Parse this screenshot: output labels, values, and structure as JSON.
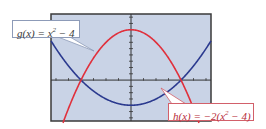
{
  "figure": {
    "background_color": "#c9d3e6",
    "border_color": "#3a3a3a"
  },
  "labels": {
    "g": {
      "prefix": "g(x) = x",
      "exp": "2",
      "suffix": " − 4",
      "color": "#2b3a8f"
    },
    "h": {
      "prefix": "h(x) = −2(x",
      "exp": "2",
      "suffix": " − 4)",
      "color": "#e0303c"
    }
  },
  "chart_data": {
    "type": "line",
    "title": "",
    "xlabel": "",
    "ylabel": "",
    "xlim": [
      -3.2,
      3.2
    ],
    "ylim": [
      -6.5,
      10.5
    ],
    "grid": false,
    "x_tick_step": 0.5,
    "y_tick_step": 1,
    "series": [
      {
        "name": "g(x) = x^2 - 4",
        "expression": "x^2 - 4",
        "color": "#2b3a8f",
        "x": [
          -3.2,
          -3,
          -2.5,
          -2,
          -1.5,
          -1,
          -0.5,
          0,
          0.5,
          1,
          1.5,
          2,
          2.5,
          3,
          3.2
        ],
        "y": [
          6.24,
          5,
          2.25,
          0,
          -1.75,
          -3,
          -3.75,
          -4,
          -3.75,
          -3,
          -1.75,
          0,
          2.25,
          5,
          6.24
        ]
      },
      {
        "name": "h(x) = -2(x^2 - 4)",
        "expression": "-2(x^2 - 4)",
        "color": "#e0303c",
        "x": [
          -2.5,
          -2,
          -1.5,
          -1,
          -0.5,
          0,
          0.5,
          1,
          1.5,
          2,
          2.5
        ],
        "y": [
          -4.5,
          0,
          3.5,
          6,
          7.5,
          8,
          7.5,
          6,
          3.5,
          0,
          -4.5
        ]
      }
    ],
    "annotations": [
      {
        "text": "g(x) = x^2 - 4",
        "position": "upper-left"
      },
      {
        "text": "h(x) = -2(x^2 - 4)",
        "position": "lower-right"
      }
    ],
    "intersections": [
      [
        -2,
        0
      ],
      [
        2,
        0
      ]
    ]
  }
}
